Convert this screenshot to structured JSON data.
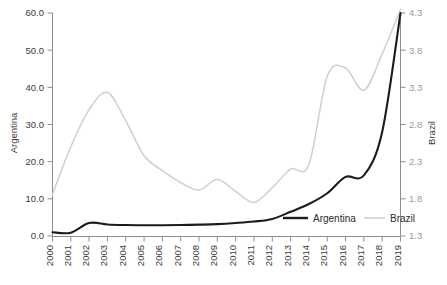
{
  "chart_data": {
    "type": "line",
    "title": "",
    "xlabel": "",
    "categories": [
      "2000",
      "2001",
      "2002",
      "2003",
      "2004",
      "2005",
      "2006",
      "2007",
      "2008",
      "2009",
      "2010",
      "2011",
      "2012",
      "2013",
      "2014",
      "2015",
      "2016",
      "2017",
      "2018",
      "2019"
    ],
    "grid": false,
    "legend_position": "inside-bottom-right",
    "axes": {
      "left": {
        "label": "Argentina",
        "ticks": [
          "0.0",
          "10.0",
          "20.0",
          "30.0",
          "40.0",
          "50.0",
          "60.0"
        ],
        "tick_values": [
          0,
          10,
          20,
          30,
          40,
          50,
          60
        ],
        "min": 0,
        "max": 60,
        "step": 10
      },
      "right": {
        "label": "Brazil",
        "ticks": [
          "1.3",
          "1.8",
          "2.3",
          "2.8",
          "3.3",
          "3.8",
          "4.3"
        ],
        "tick_values": [
          1.3,
          1.8,
          2.3,
          2.8,
          3.3,
          3.8,
          4.3
        ],
        "min": 1.3,
        "max": 4.3,
        "step": 0.5
      }
    },
    "series": [
      {
        "name": "Argentina",
        "axis": "left",
        "color": "#1c1c1c",
        "values": [
          1.0,
          0.9,
          3.5,
          3.1,
          2.95,
          2.9,
          2.9,
          2.95,
          3.05,
          3.2,
          3.5,
          3.9,
          4.6,
          6.5,
          8.6,
          11.5,
          15.9,
          16.3,
          28.0,
          60.0
        ]
      },
      {
        "name": "Brazil",
        "axis": "right",
        "color": "#cfcfcf",
        "values": [
          1.86,
          2.5,
          3.0,
          3.23,
          2.85,
          2.38,
          2.18,
          2.02,
          1.92,
          2.06,
          1.9,
          1.75,
          1.95,
          2.2,
          2.26,
          3.45,
          3.56,
          3.26,
          3.75,
          4.35
        ]
      }
    ],
    "legend": [
      {
        "label": "Argentina",
        "color": "#1c1c1c",
        "style": "thick-solid"
      },
      {
        "label": "Brazil",
        "color": "#cfcfcf",
        "style": "thin-solid"
      }
    ]
  },
  "caption": ""
}
